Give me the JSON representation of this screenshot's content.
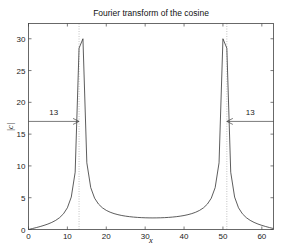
{
  "chart_data": {
    "type": "line",
    "title": "Fourier transform of the cosine",
    "xlabel": "x",
    "ylabel": "|c|",
    "xlim": [
      0,
      63
    ],
    "ylim": [
      0,
      32.4
    ],
    "grid": false,
    "legend": null,
    "x_ticks": [
      0,
      10,
      20,
      30,
      40,
      50,
      60
    ],
    "y_ticks": [
      0,
      5,
      10,
      15,
      20,
      25,
      30
    ],
    "signal": {
      "N": 64,
      "peak_positions": [
        13,
        51
      ],
      "peak_height": 30,
      "value_at_x0": 1.1,
      "min_value_near_x32": 0.2
    },
    "reference_lines": [
      {
        "x": 13,
        "style": "dotted"
      },
      {
        "x": 51,
        "style": "dotted"
      }
    ],
    "annotations": [
      {
        "text": "13",
        "arrow_from_x": 0,
        "arrow_to_x": 13,
        "y": 17,
        "direction": "right"
      },
      {
        "text": "13",
        "arrow_from_x": 63,
        "arrow_to_x": 51,
        "y": 17,
        "direction": "left"
      }
    ]
  },
  "colors": {
    "line": "#333333",
    "axis": "#444444",
    "dotted": "#999999"
  }
}
